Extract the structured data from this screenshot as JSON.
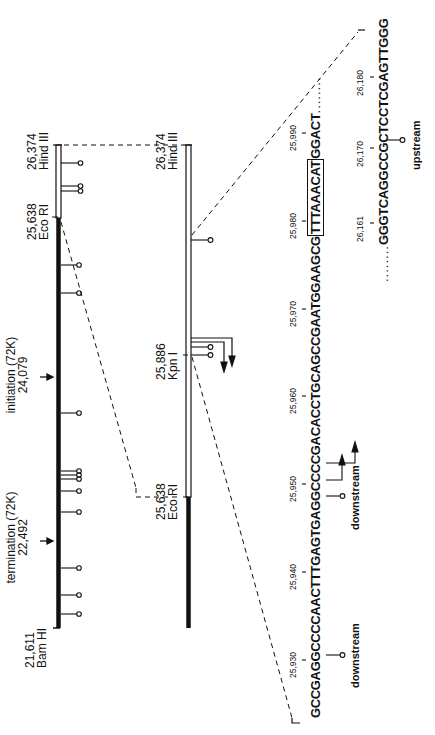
{
  "figure": {
    "orientation": "rotated 90 degrees counterclockwise",
    "map_overview": {
      "left_end": {
        "position": "21,611",
        "enzyme": "Bam HI"
      },
      "ecori_site": {
        "position": "25,638",
        "enzyme": "Eco RI"
      },
      "right_end": {
        "position": "26,374",
        "enzyme": "Hind III"
      },
      "termination": {
        "label": "termination (72K)",
        "position": "22,492"
      },
      "initiation": {
        "label": "initiation (72K)",
        "position": "24,079"
      }
    },
    "map_detail": {
      "left": {
        "position": "25,638",
        "enzyme": "Eco RI"
      },
      "kpn": {
        "position": "25,886",
        "enzyme": "Kpn I"
      },
      "right": {
        "position": "26,374",
        "enzyme": "Hind III"
      }
    },
    "sequence_1": {
      "ticks": [
        "25,930",
        "25,940",
        "25,950",
        "25,960",
        "25,970",
        "25,980",
        "25,990"
      ],
      "seg_a": "GCCGAGGCCCCAACTTTGAGTGAGGCCCCGACACCTGCAGCCGAATGGAAGCG",
      "boxed": "TTTAAACAT",
      "seg_b": "GGACT",
      "trail": "........",
      "annotations": [
        "downstream",
        "downstream"
      ]
    },
    "sequence_2": {
      "ticks": [
        "26,161",
        "26,170",
        "26,180"
      ],
      "lead": "........",
      "seq": "GGGTCAGGCCGCTCCTCGAGTTGGG",
      "annotation": "upstream"
    }
  }
}
